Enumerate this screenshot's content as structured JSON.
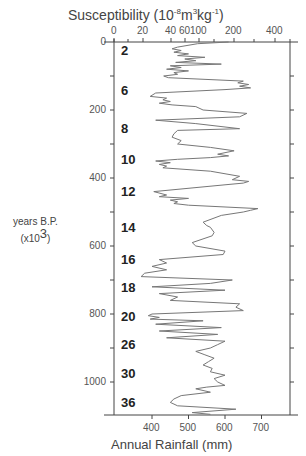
{
  "chart_data": {
    "type": "line",
    "orientation": "vertical-time",
    "title": "",
    "top_axis": {
      "label": "Susceptibility (10-8m3kg-1)",
      "label_parts": {
        "base": "Susceptibility (10",
        "exp1": "-8",
        "mid": "m",
        "exp2": "3",
        "mid2": "kg",
        "exp3": "-1",
        "end": ")"
      },
      "ticks": [
        "0",
        "20",
        "40",
        "60",
        "100",
        "200",
        "400"
      ],
      "scale": "nonlinear"
    },
    "xlabel": "Annual Rainfall (mm)",
    "xticks": [
      400,
      500,
      600,
      700
    ],
    "xlim": [
      296,
      778
    ],
    "ylabel": "years B.P. (x10^3)",
    "ylabel_parts": {
      "line1": "years B.P.",
      "line2_pre": "(x10",
      "line2_exp": "3",
      "line2_post": ")"
    },
    "yticks": [
      0,
      200,
      400,
      600,
      800,
      1000
    ],
    "ylim": [
      0,
      1100
    ],
    "y_inverted": true,
    "grid": false,
    "annotations": {
      "stage_labels": [
        {
          "label": "2",
          "y": 25
        },
        {
          "label": "6",
          "y": 145
        },
        {
          "label": "8",
          "y": 255
        },
        {
          "label": "10",
          "y": 348
        },
        {
          "label": "12",
          "y": 440
        },
        {
          "label": "14",
          "y": 548
        },
        {
          "label": "16",
          "y": 640
        },
        {
          "label": "18",
          "y": 723
        },
        {
          "label": "20",
          "y": 808
        },
        {
          "label": "26",
          "y": 892
        },
        {
          "label": "30",
          "y": 977
        },
        {
          "label": "36",
          "y": 1062
        }
      ]
    },
    "series": [
      {
        "name": "Annual Rainfall",
        "y": [
          0,
          5,
          15,
          20,
          25,
          30,
          35,
          40,
          45,
          50,
          55,
          60,
          65,
          70,
          75,
          80,
          85,
          90,
          95,
          100,
          105,
          115,
          120,
          125,
          130,
          135,
          140,
          150,
          160,
          165,
          170,
          175,
          180,
          185,
          190,
          200,
          210,
          220,
          230,
          240,
          255,
          260,
          270,
          280,
          290,
          300,
          310,
          320,
          330,
          335,
          340,
          345,
          350,
          355,
          360,
          365,
          370,
          380,
          395,
          405,
          410,
          415,
          420,
          440,
          450,
          455,
          460,
          465,
          470,
          475,
          480,
          490,
          495,
          500,
          510,
          530,
          540,
          545,
          560,
          570,
          590,
          600,
          615,
          625,
          640,
          650,
          660,
          670,
          680,
          690,
          700,
          710,
          720,
          730,
          740,
          750,
          760,
          770,
          780,
          790,
          800,
          805,
          810,
          815,
          820,
          830,
          840,
          850,
          860,
          870,
          880,
          890,
          900,
          910,
          920,
          930,
          940,
          950,
          960,
          970,
          980,
          990,
          1000,
          1010,
          1015,
          1020,
          1030,
          1040,
          1050,
          1060,
          1070,
          1080,
          1090,
          1095
        ],
        "values": [
          610,
          525,
          470,
          455,
          480,
          460,
          500,
          470,
          545,
          490,
          520,
          465,
          590,
          450,
          480,
          440,
          500,
          460,
          470,
          432,
          445,
          650,
          635,
          665,
          640,
          670,
          600,
          410,
          395,
          440,
          430,
          450,
          420,
          455,
          520,
          540,
          660,
          640,
          410,
          520,
          640,
          470,
          460,
          455,
          480,
          470,
          560,
          625,
          580,
          610,
          560,
          470,
          410,
          450,
          420,
          440,
          430,
          560,
          640,
          620,
          665,
          650,
          600,
          405,
          440,
          420,
          500,
          450,
          470,
          460,
          500,
          690,
          670,
          650,
          590,
          540,
          550,
          560,
          570,
          565,
          510,
          520,
          600,
          595,
          420,
          440,
          400,
          440,
          380,
          370,
          620,
          560,
          400,
          600,
          420,
          470,
          450,
          640,
          630,
          650,
          400,
          390,
          420,
          395,
          540,
          410,
          590,
          420,
          580,
          440,
          600,
          580,
          560,
          520,
          545,
          570,
          555,
          540,
          565,
          560,
          600,
          570,
          580,
          600,
          550,
          520,
          560,
          480,
          460,
          450,
          470,
          630,
          510,
          560
        ]
      }
    ]
  },
  "colors": {
    "line": "#777777",
    "axis": "#444444",
    "text": "#333333"
  }
}
